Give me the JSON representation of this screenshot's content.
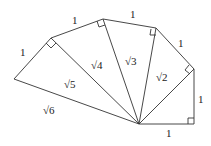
{
  "diagram": {
    "labels": {
      "leg1": "1",
      "leg2": "1",
      "leg3": "1",
      "leg4": "1",
      "leg5": "1",
      "leg6": "1",
      "hyp2": "√2",
      "hyp3": "√3",
      "hyp4": "√4",
      "hyp5": "√5",
      "hyp6": "√6"
    }
  }
}
